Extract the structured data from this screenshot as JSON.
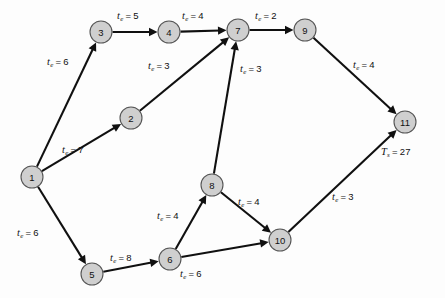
{
  "diagram": {
    "node_fill": "#cfcfcf",
    "node_stroke": "#555555",
    "edge_color": "#101010",
    "background": "#fdfdfd",
    "nodes": [
      {
        "id": "1",
        "label": "1",
        "x": 32,
        "y": 177,
        "r": 11
      },
      {
        "id": "2",
        "label": "2",
        "x": 131,
        "y": 118,
        "r": 11
      },
      {
        "id": "3",
        "label": "3",
        "x": 101,
        "y": 32,
        "r": 11
      },
      {
        "id": "4",
        "label": "4",
        "x": 169,
        "y": 32,
        "r": 11
      },
      {
        "id": "5",
        "label": "5",
        "x": 92,
        "y": 274,
        "r": 11
      },
      {
        "id": "6",
        "label": "6",
        "x": 170,
        "y": 259,
        "r": 11
      },
      {
        "id": "7",
        "label": "7",
        "x": 238,
        "y": 30,
        "r": 11
      },
      {
        "id": "8",
        "label": "8",
        "x": 212,
        "y": 185,
        "r": 11
      },
      {
        "id": "9",
        "label": "9",
        "x": 305,
        "y": 30,
        "r": 11
      },
      {
        "id": "10",
        "label": "10",
        "x": 280,
        "y": 240,
        "r": 11
      },
      {
        "id": "11",
        "label": "11",
        "x": 405,
        "y": 122,
        "r": 11
      }
    ],
    "edges": [
      {
        "from": "1",
        "to": "3",
        "symbol": "t",
        "subscript": "e",
        "value": 6,
        "label_x": 47,
        "label_y": 56
      },
      {
        "from": "1",
        "to": "2",
        "symbol": "t",
        "subscript": "e",
        "value": 7,
        "label_x": 62,
        "label_y": 144
      },
      {
        "from": "1",
        "to": "5",
        "symbol": "t",
        "subscript": "e",
        "value": 6,
        "label_x": 17,
        "label_y": 227
      },
      {
        "from": "3",
        "to": "4",
        "symbol": "t",
        "subscript": "e",
        "value": 5,
        "label_x": 117,
        "label_y": 10
      },
      {
        "from": "4",
        "to": "7",
        "symbol": "t",
        "subscript": "e",
        "value": 4,
        "label_x": 182,
        "label_y": 10
      },
      {
        "from": "2",
        "to": "7",
        "symbol": "t",
        "subscript": "e",
        "value": 3,
        "label_x": 148,
        "label_y": 60
      },
      {
        "from": "8",
        "to": "7",
        "symbol": "t",
        "subscript": "e",
        "value": 3,
        "label_x": 240,
        "label_y": 63
      },
      {
        "from": "7",
        "to": "9",
        "symbol": "t",
        "subscript": "e",
        "value": 2,
        "label_x": 255,
        "label_y": 10
      },
      {
        "from": "9",
        "to": "11",
        "symbol": "t",
        "subscript": "e",
        "value": 4,
        "label_x": 353,
        "label_y": 59
      },
      {
        "from": "5",
        "to": "6",
        "symbol": "t",
        "subscript": "e",
        "value": 8,
        "label_x": 110,
        "label_y": 252
      },
      {
        "from": "6",
        "to": "8",
        "symbol": "t",
        "subscript": "e",
        "value": 4,
        "label_x": 157,
        "label_y": 210
      },
      {
        "from": "6",
        "to": "10",
        "symbol": "t",
        "subscript": "e",
        "value": 6,
        "label_x": 180,
        "label_y": 268
      },
      {
        "from": "8",
        "to": "10",
        "symbol": "t",
        "subscript": "e",
        "value": 4,
        "label_x": 238,
        "label_y": 196
      },
      {
        "from": "10",
        "to": "11",
        "symbol": "t",
        "subscript": "e",
        "value": 3,
        "label_x": 332,
        "label_y": 191
      }
    ],
    "annotations": [
      {
        "id": "total-time",
        "symbol": "T",
        "subscript": "s",
        "value": 27,
        "x": 381,
        "y": 146
      }
    ]
  }
}
